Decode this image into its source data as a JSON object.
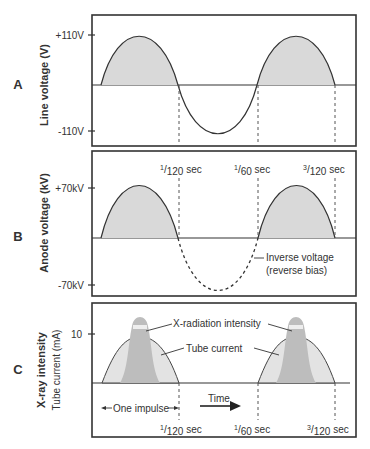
{
  "panels": [
    {
      "letter": "A",
      "ylabel": "Line voltage (V)",
      "ticks": [
        "+110V",
        "-110V"
      ],
      "time_labels": []
    },
    {
      "letter": "B",
      "ylabel": "Anode voltage (kV)",
      "ticks": [
        "+70kV",
        "-70kV"
      ],
      "time_labels": [
        {
          "num": "1",
          "den": "120",
          "unit": "sec"
        },
        {
          "num": "1",
          "den": "60",
          "unit": "sec"
        },
        {
          "num": "3",
          "den": "120",
          "unit": "sec"
        }
      ],
      "annotation": [
        "Inverse voltage",
        "(reverse bias)"
      ]
    },
    {
      "letter": "C",
      "ylabel_primary": "X-ray intensity",
      "ylabel_secondary": "Tube current (mA)",
      "ticks": [
        "10"
      ],
      "annotations": {
        "xray": "X-radiation intensity",
        "tube": "Tube current",
        "impulse": "One impulse",
        "time": "Time"
      },
      "time_labels": [
        {
          "num": "1",
          "den": "120",
          "unit": "sec"
        },
        {
          "num": "1",
          "den": "60",
          "unit": "sec"
        },
        {
          "num": "3",
          "den": "120",
          "unit": "sec"
        }
      ]
    }
  ],
  "colors": {
    "fill_light": "#d9d9d9",
    "fill_dark": "#bdbdbd",
    "line": "#333333"
  }
}
